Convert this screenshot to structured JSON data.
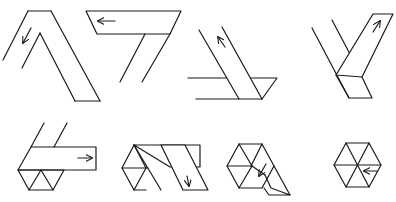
{
  "diagram": {
    "title": "Folding a paper strip into a hexagon",
    "stroke_color": "#1a1a1a",
    "background": "#ffffff",
    "steps": [
      {
        "id": 1,
        "row": 1,
        "arrow_direction": "down-left"
      },
      {
        "id": 2,
        "row": 1,
        "arrow_direction": "left"
      },
      {
        "id": 3,
        "row": 1,
        "arrow_direction": "up-left"
      },
      {
        "id": 4,
        "row": 1,
        "arrow_direction": "up-right"
      },
      {
        "id": 5,
        "row": 2,
        "arrow_direction": "right"
      },
      {
        "id": 6,
        "row": 2,
        "arrow_direction": "down"
      },
      {
        "id": 7,
        "row": 2,
        "arrow_direction": "down-left"
      },
      {
        "id": 8,
        "row": 2,
        "arrow_direction": "left"
      }
    ]
  }
}
